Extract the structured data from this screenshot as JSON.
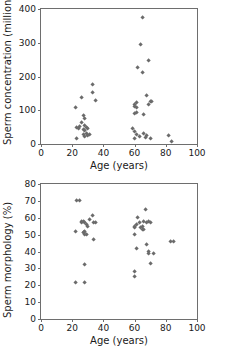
{
  "figure": {
    "name": "sperm-parameters-vs-age-scatter-figure",
    "marker_color": "#6b6b6b",
    "axis_color": "#6e6e6e",
    "background": "#ffffff"
  },
  "chart_data": [
    {
      "type": "scatter",
      "id": "sperm-concentration",
      "title": "",
      "xlabel": "Age (years)",
      "ylabel": "Sperm concentration (million/ml)",
      "xlim": [
        0,
        100
      ],
      "ylim": [
        0,
        400
      ],
      "xticks": [
        0,
        20,
        40,
        60,
        80,
        100
      ],
      "yticks": [
        0,
        100,
        200,
        300,
        400
      ],
      "grid": false,
      "legend": "none",
      "marker": "diamond",
      "points": [
        [
          22,
          108
        ],
        [
          23,
          48
        ],
        [
          23,
          17
        ],
        [
          24,
          46
        ],
        [
          25,
          52
        ],
        [
          26,
          137
        ],
        [
          26,
          63
        ],
        [
          27,
          84
        ],
        [
          27,
          44
        ],
        [
          27,
          28
        ],
        [
          28,
          74
        ],
        [
          28,
          56
        ],
        [
          28,
          40
        ],
        [
          28,
          22
        ],
        [
          29,
          50
        ],
        [
          29,
          31
        ],
        [
          30,
          46
        ],
        [
          30,
          26
        ],
        [
          31,
          27
        ],
        [
          33,
          151
        ],
        [
          33,
          177
        ],
        [
          35,
          128
        ],
        [
          59,
          46
        ],
        [
          60,
          112
        ],
        [
          60,
          118
        ],
        [
          60,
          89
        ],
        [
          60,
          37
        ],
        [
          60,
          17
        ],
        [
          61,
          108
        ],
        [
          61,
          124
        ],
        [
          61,
          94
        ],
        [
          61,
          28
        ],
        [
          62,
          227
        ],
        [
          63,
          22
        ],
        [
          64,
          296
        ],
        [
          65,
          211
        ],
        [
          65,
          376
        ],
        [
          66,
          86
        ],
        [
          66,
          31
        ],
        [
          67,
          19
        ],
        [
          68,
          143
        ],
        [
          68,
          24
        ],
        [
          69,
          118
        ],
        [
          69,
          247
        ],
        [
          70,
          127
        ],
        [
          70,
          16
        ],
        [
          71,
          126
        ],
        [
          82,
          24
        ],
        [
          84,
          7
        ]
      ]
    },
    {
      "type": "scatter",
      "id": "sperm-morphology",
      "title": "",
      "xlabel": "Age (years)",
      "ylabel": "Sperm morphology (%)",
      "xlim": [
        0,
        100
      ],
      "ylim": [
        0,
        80
      ],
      "xticks": [
        0,
        20,
        40,
        60,
        80,
        100
      ],
      "yticks": [
        0,
        10,
        20,
        30,
        40,
        50,
        60,
        70,
        80
      ],
      "grid": false,
      "legend": "none",
      "marker": "diamond",
      "points": [
        [
          22,
          52
        ],
        [
          22,
          21.5
        ],
        [
          23,
          70
        ],
        [
          25,
          70
        ],
        [
          26,
          58
        ],
        [
          26,
          57
        ],
        [
          27,
          58
        ],
        [
          27,
          51
        ],
        [
          27.5,
          51
        ],
        [
          28,
          57
        ],
        [
          28,
          52
        ],
        [
          28,
          50
        ],
        [
          28,
          32
        ],
        [
          28,
          21.5
        ],
        [
          29,
          50
        ],
        [
          29,
          56
        ],
        [
          30,
          55
        ],
        [
          31,
          59
        ],
        [
          33,
          61
        ],
        [
          34,
          57
        ],
        [
          35,
          57
        ],
        [
          34,
          47
        ],
        [
          60,
          54
        ],
        [
          60,
          55
        ],
        [
          60,
          50
        ],
        [
          60,
          28
        ],
        [
          60,
          25
        ],
        [
          61,
          56
        ],
        [
          61,
          42
        ],
        [
          62,
          60
        ],
        [
          63,
          57
        ],
        [
          64,
          54
        ],
        [
          65,
          55
        ],
        [
          65,
          53
        ],
        [
          66,
          58
        ],
        [
          66,
          53
        ],
        [
          67,
          65
        ],
        [
          68,
          44
        ],
        [
          68,
          57
        ],
        [
          69,
          58
        ],
        [
          69,
          40
        ],
        [
          69,
          39
        ],
        [
          70,
          57
        ],
        [
          70,
          33
        ],
        [
          72,
          39
        ],
        [
          83,
          46
        ],
        [
          85,
          46
        ]
      ]
    }
  ]
}
